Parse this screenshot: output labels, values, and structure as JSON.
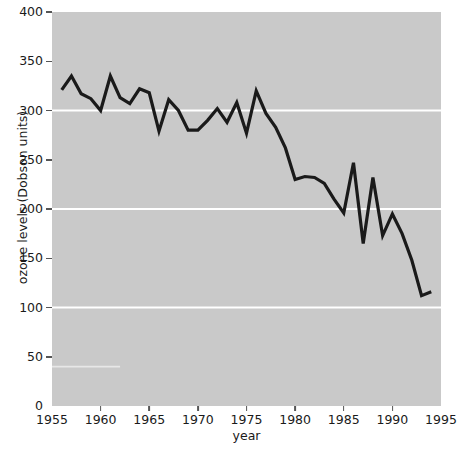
{
  "chart_data": {
    "type": "line",
    "title": "",
    "xlabel": "year",
    "ylabel": "ozone levels (Dobson units)",
    "xlim": [
      1955,
      1995
    ],
    "ylim": [
      0,
      400
    ],
    "xticks": [
      1955,
      1960,
      1965,
      1970,
      1975,
      1980,
      1985,
      1990,
      1995
    ],
    "yticks": [
      0,
      50,
      100,
      150,
      200,
      250,
      300,
      350,
      400
    ],
    "gridlines": {
      "y_major": [
        100,
        200,
        300
      ],
      "color": "#ffffff",
      "x_grid": false
    },
    "plot_background": "#c9c9c9",
    "line_color": "#1a1a1a",
    "line_width": 3.2,
    "legend": null,
    "series": [
      {
        "name": "ozone levels (Dobson units)",
        "x": [
          1956,
          1957,
          1958,
          1959,
          1960,
          1961,
          1962,
          1963,
          1964,
          1965,
          1966,
          1967,
          1968,
          1969,
          1970,
          1971,
          1972,
          1973,
          1974,
          1975,
          1976,
          1977,
          1978,
          1979,
          1980,
          1981,
          1982,
          1983,
          1984,
          1985,
          1986,
          1987,
          1988,
          1989,
          1990,
          1991,
          1992,
          1993,
          1994
        ],
        "y": [
          321,
          335,
          317,
          312,
          300,
          335,
          313,
          307,
          322,
          318,
          279,
          311,
          300,
          280,
          280,
          290,
          302,
          288,
          308,
          277,
          320,
          297,
          283,
          262,
          230,
          233,
          232,
          226,
          210,
          196,
          247,
          165,
          232,
          173,
          195,
          175,
          148,
          112,
          116
        ]
      }
    ]
  },
  "axis": {
    "y_tick_labels": [
      "400",
      "350",
      "300",
      "250",
      "200",
      "150",
      "100",
      "50",
      "0"
    ],
    "x_tick_labels": [
      "1955",
      "1960",
      "1965",
      "1970",
      "1975",
      "1980",
      "1985",
      "1990",
      "1995"
    ]
  }
}
